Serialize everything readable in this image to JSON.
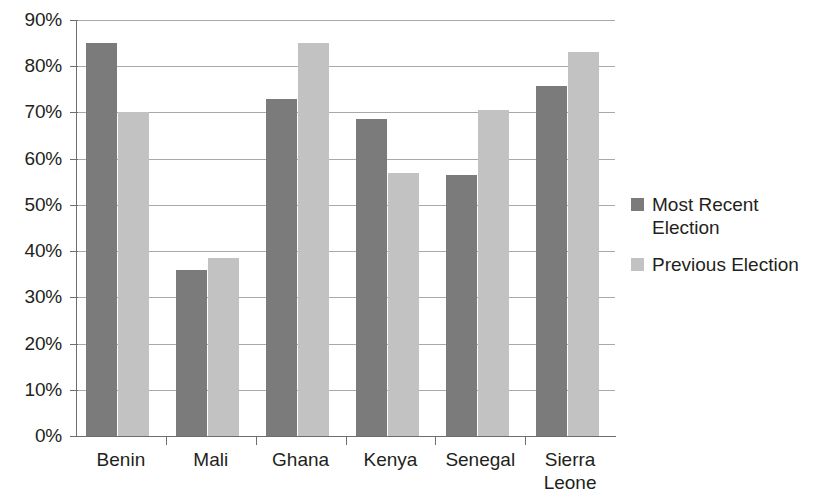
{
  "chart_data": {
    "type": "bar",
    "title": "",
    "xlabel": "",
    "ylabel": "",
    "ylim": [
      0,
      90
    ],
    "ytick_labels": [
      "0%",
      "10%",
      "20%",
      "30%",
      "40%",
      "50%",
      "60%",
      "70%",
      "80%",
      "90%"
    ],
    "ytick_values": [
      0,
      10,
      20,
      30,
      40,
      50,
      60,
      70,
      80,
      90
    ],
    "grid": true,
    "legend_position": "right",
    "categories": [
      "Benin",
      "Mali",
      "Ghana",
      "Kenya",
      "Senegal",
      "Sierra Leone"
    ],
    "series": [
      {
        "name": "Most Recent Election",
        "legend_label": "Most Recent\nElection",
        "color": "#7b7b7b",
        "values": [
          85,
          36,
          73,
          68.5,
          56.5,
          75.8
        ]
      },
      {
        "name": "Previous Election",
        "legend_label": "Previous Election",
        "color": "#c2c2c2",
        "values": [
          70,
          38.5,
          85,
          57,
          70.5,
          83
        ]
      }
    ]
  },
  "axis": {
    "line_color": "#6d6e71",
    "grid_color": "#a7a9ac"
  }
}
